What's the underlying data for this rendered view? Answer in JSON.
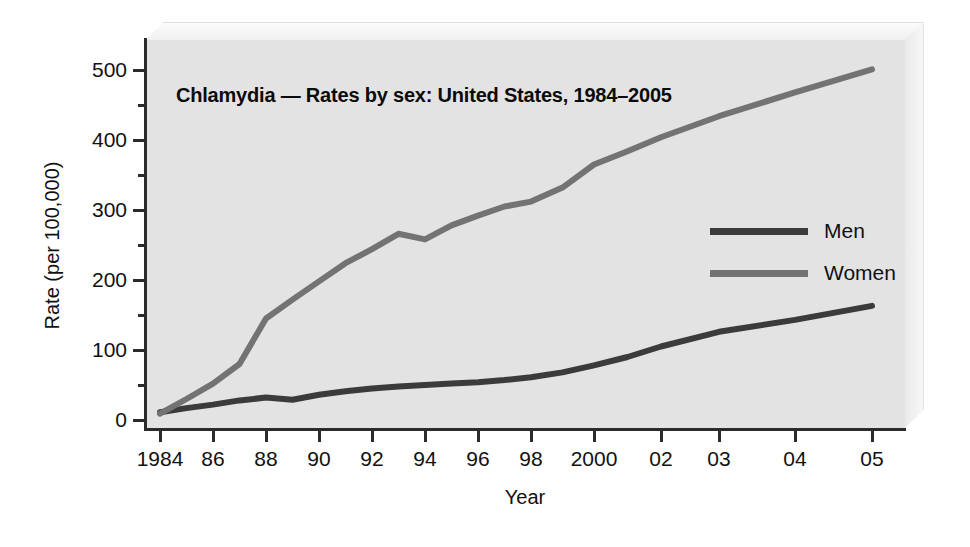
{
  "figure": {
    "title": "Chlamydia — Rates by sex: United States, 1984–2005",
    "xlabel": "Year",
    "ylabel": "Rate (per 100,000)"
  },
  "legend": {
    "items": [
      {
        "label": "Men",
        "color": "#3b3b3b"
      },
      {
        "label": "Women",
        "color": "#737373"
      }
    ]
  },
  "colors": {
    "men": "#3b3b3b",
    "women": "#737373",
    "panel": "#e3e3e3",
    "axis": "#2b2b2b",
    "page": "#ffffff"
  },
  "chart_data": {
    "type": "line",
    "title": "Chlamydia — Rates by sex: United States, 1984–2005",
    "xlabel": "Year",
    "ylabel": "Rate (per 100,000)",
    "grid": false,
    "legend_position": "right-middle",
    "x": [
      1984,
      1985,
      1986,
      1987,
      1988,
      1989,
      1990,
      1991,
      1992,
      1993,
      1994,
      1995,
      1996,
      1997,
      1998,
      1999,
      2000,
      2001,
      2002,
      2003,
      2004,
      2005
    ],
    "xtick_labels": [
      "1984",
      "86",
      "88",
      "90",
      "92",
      "94",
      "96",
      "98",
      "2000",
      "02",
      "03",
      "04",
      "05"
    ],
    "xtick_values": [
      1984,
      1986,
      1988,
      1990,
      1992,
      1994,
      1996,
      1998,
      2000,
      2002,
      2003,
      2004,
      2005
    ],
    "xlim": [
      1984,
      2005
    ],
    "ylim": [
      0,
      540
    ],
    "ytick_values": [
      0,
      100,
      200,
      300,
      400,
      500
    ],
    "ytick_labels": [
      "0",
      "100",
      "200",
      "300",
      "400",
      "500"
    ],
    "yminor_values": [
      50,
      150,
      250,
      350,
      450
    ],
    "series": [
      {
        "name": "Men",
        "color": "#3b3b3b",
        "values": [
          11,
          17,
          22,
          28,
          32,
          29,
          36,
          41,
          45,
          48,
          50,
          52,
          54,
          57,
          61,
          68,
          78,
          90,
          105,
          126,
          143,
          163
        ]
      },
      {
        "name": "Women",
        "color": "#737373",
        "values": [
          9,
          30,
          52,
          80,
          145,
          172,
          198,
          224,
          244,
          266,
          258,
          278,
          292,
          305,
          312,
          332,
          365,
          384,
          404,
          434,
          468,
          501
        ]
      }
    ]
  }
}
